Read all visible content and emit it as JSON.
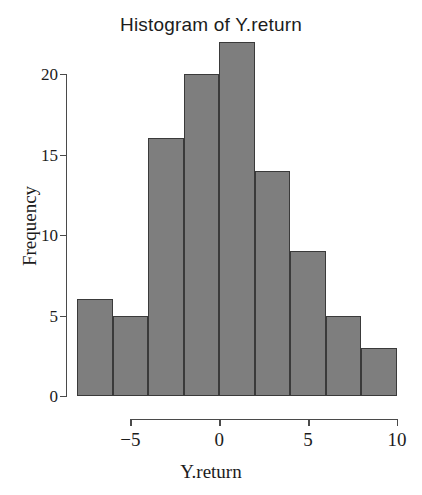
{
  "chart_data": {
    "type": "bar",
    "title": "Histogram of Y.return",
    "xlabel": "Y.return",
    "ylabel": "Frequency",
    "categories": [
      "[-8,-6]",
      "[-6,-4]",
      "[-4,-2]",
      "[-2,0]",
      "[0,2]",
      "[2,4]",
      "[4,6]",
      "[6,8]",
      "[8,10]"
    ],
    "bin_edges": [
      -8,
      -6,
      -4,
      -2,
      0,
      2,
      4,
      6,
      8,
      10
    ],
    "values": [
      6,
      5,
      16,
      20,
      22,
      14,
      9,
      5,
      3
    ],
    "bin_width": 2,
    "xlim": [
      -8,
      10
    ],
    "ylim": [
      0,
      22
    ],
    "x_ticks": [
      -5,
      0,
      5,
      10
    ],
    "x_tick_labels": [
      "−5",
      "0",
      "5",
      "10"
    ],
    "y_ticks": [
      0,
      5,
      10,
      15,
      20
    ],
    "y_tick_labels": [
      "0",
      "5",
      "10",
      "15",
      "20"
    ],
    "grid": false,
    "legend": false,
    "bar_fill_color": "#7e7e7e",
    "bar_border_color": "#3a3a3a",
    "axis_color": "#4a4a4a",
    "background_color": "#ffffff"
  }
}
